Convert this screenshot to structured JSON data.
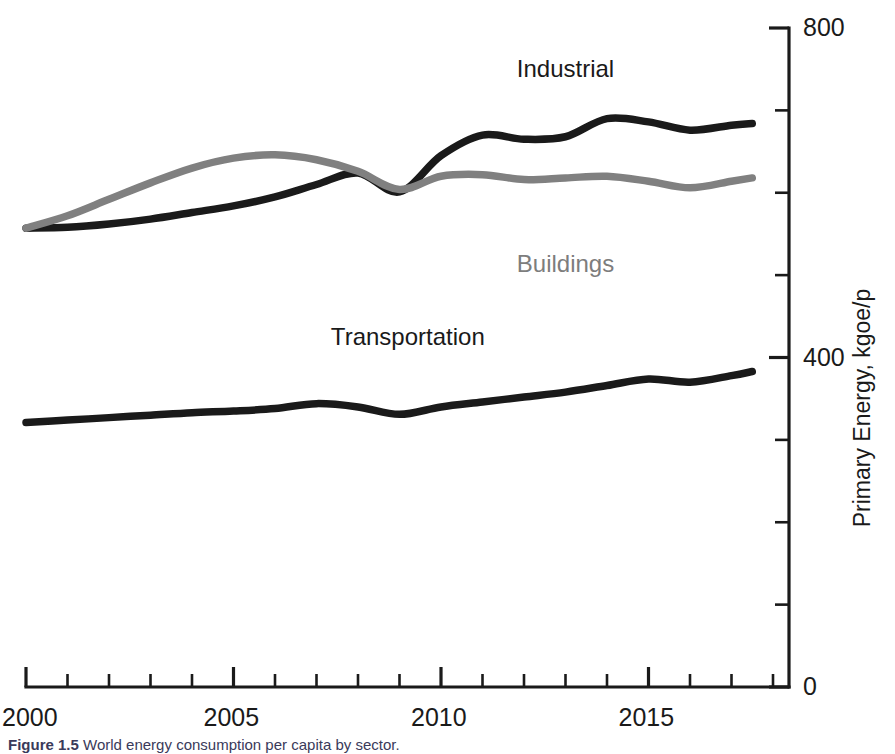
{
  "chart_data": {
    "type": "line",
    "title": "",
    "subtitle": "",
    "xlabel": "",
    "ylabel": "Primary Energy, kgoe/p",
    "xlim": [
      2000,
      2017.5
    ],
    "ylim": [
      0,
      800
    ],
    "grid": false,
    "legend_position": "inline-annotations",
    "x_ticks_major": [
      2000,
      2005,
      2010,
      2015
    ],
    "x_tick_labels": [
      "2000",
      "2005",
      "2010",
      "2015"
    ],
    "x_ticks_minor_interval": 1,
    "y_ticks_major": [
      0,
      400,
      800
    ],
    "y_tick_labels": [
      "0",
      "400",
      "800"
    ],
    "y_ticks_minor_interval": 100,
    "y_axis_side": "right",
    "series": [
      {
        "name": "Industrial",
        "color": "#1a1a1a",
        "x": [
          2000,
          2001,
          2002,
          2003,
          2004,
          2005,
          2006,
          2007,
          2008,
          2009,
          2010,
          2011,
          2012,
          2013,
          2014,
          2015,
          2016,
          2017,
          2017.5
        ],
        "values": [
          557,
          558,
          562,
          568,
          576,
          584,
          595,
          610,
          624,
          601,
          645,
          670,
          665,
          668,
          690,
          686,
          676,
          682,
          684
        ]
      },
      {
        "name": "Buildings",
        "color": "#808080",
        "x": [
          2000,
          2001,
          2002,
          2003,
          2004,
          2005,
          2006,
          2007,
          2008,
          2009,
          2010,
          2011,
          2012,
          2013,
          2014,
          2015,
          2016,
          2017,
          2017.5
        ],
        "values": [
          557,
          572,
          592,
          612,
          630,
          642,
          646,
          640,
          626,
          604,
          620,
          622,
          616,
          618,
          620,
          614,
          606,
          614,
          618
        ]
      },
      {
        "name": "Transportation",
        "color": "#1a1a1a",
        "x": [
          2000,
          2001,
          2002,
          2003,
          2004,
          2005,
          2006,
          2007,
          2008,
          2009,
          2010,
          2011,
          2012,
          2013,
          2014,
          2015,
          2016,
          2017,
          2017.5
        ],
        "values": [
          321,
          324,
          327,
          330,
          333,
          335,
          338,
          344,
          340,
          331,
          340,
          346,
          352,
          358,
          366,
          374,
          370,
          378,
          383
        ]
      }
    ],
    "annotations": [
      {
        "text": "Industrial",
        "x": 2013.0,
        "y": 765,
        "color": "#1a1a1a"
      },
      {
        "text": "Buildings",
        "x": 2013.0,
        "y": 528,
        "color": "#7d7d7d"
      },
      {
        "text": "Transportation",
        "x": 2009.2,
        "y": 440,
        "color": "#1a1a1a"
      }
    ]
  },
  "axis": {
    "y_title": "Primary Energy, kgoe/p",
    "y_labels": {
      "zero": "0",
      "mid": "400",
      "top": "800"
    },
    "x_labels": {
      "t2000": "2000",
      "t2005": "2005",
      "t2010": "2010",
      "t2015": "2015"
    }
  },
  "series_labels": {
    "industrial": "Industrial",
    "buildings": "Buildings",
    "transportation": "Transportation"
  },
  "caption": {
    "number": "Figure 1.5",
    "text": "World energy consumption per capita by sector."
  },
  "colors": {
    "industrial": "#1a1a1a",
    "buildings": "#808080",
    "transportation": "#1a1a1a",
    "axis": "#1a1a1a",
    "background": "#ffffff"
  }
}
